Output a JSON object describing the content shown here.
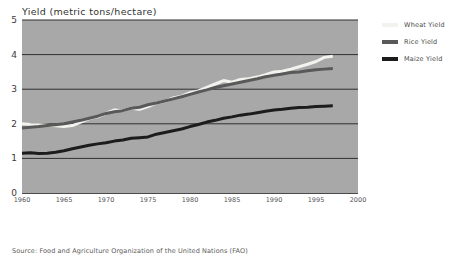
{
  "chart_data": {
    "type": "line",
    "title": "Yield (metric tons/hectare)",
    "xlabel": "",
    "ylabel": "Yield (metric tons/hectare)",
    "xlim": [
      1960,
      2000
    ],
    "ylim": [
      0,
      5
    ],
    "grid": "horizontal",
    "legend_position": "right",
    "y_ticks": [
      "5",
      "4",
      "3",
      "2",
      "1",
      "0"
    ],
    "y_tick_values": [
      5,
      4,
      3,
      2,
      1,
      0
    ],
    "x_ticks": [
      "1960",
      "1965",
      "1970",
      "1975",
      "1980",
      "1985",
      "1990",
      "1995",
      "2000"
    ],
    "x_tick_values": [
      1960,
      1965,
      1970,
      1975,
      1980,
      1985,
      1990,
      1995,
      2000
    ],
    "x": [
      1960,
      1961,
      1962,
      1963,
      1964,
      1965,
      1966,
      1967,
      1968,
      1969,
      1970,
      1971,
      1972,
      1973,
      1974,
      1975,
      1976,
      1977,
      1978,
      1979,
      1980,
      1981,
      1982,
      1983,
      1984,
      1985,
      1986,
      1987,
      1988,
      1989,
      1990,
      1991,
      1992,
      1993,
      1994,
      1995,
      1996,
      1997
    ],
    "series": [
      {
        "name": "Wheat Yield",
        "color": "#f2f2ee",
        "values": [
          2.0,
          1.98,
          1.97,
          1.96,
          1.94,
          1.92,
          1.95,
          2.05,
          2.15,
          2.2,
          2.3,
          2.4,
          2.38,
          2.45,
          2.42,
          2.5,
          2.6,
          2.65,
          2.75,
          2.8,
          2.9,
          2.95,
          3.05,
          3.15,
          3.25,
          3.2,
          3.28,
          3.3,
          3.35,
          3.42,
          3.5,
          3.52,
          3.58,
          3.65,
          3.72,
          3.8,
          3.92,
          3.95
        ]
      },
      {
        "name": "Rice Yield",
        "color": "#595959",
        "values": [
          1.88,
          1.9,
          1.92,
          1.95,
          1.97,
          2.0,
          2.05,
          2.1,
          2.16,
          2.22,
          2.3,
          2.35,
          2.38,
          2.45,
          2.48,
          2.55,
          2.6,
          2.66,
          2.72,
          2.78,
          2.85,
          2.92,
          2.98,
          3.05,
          3.1,
          3.15,
          3.2,
          3.25,
          3.3,
          3.36,
          3.4,
          3.44,
          3.48,
          3.5,
          3.53,
          3.56,
          3.58,
          3.6
        ]
      },
      {
        "name": "Maize Yield",
        "color": "#1c1c1c",
        "values": [
          1.15,
          1.16,
          1.14,
          1.15,
          1.18,
          1.22,
          1.28,
          1.33,
          1.38,
          1.42,
          1.45,
          1.5,
          1.53,
          1.58,
          1.6,
          1.62,
          1.7,
          1.75,
          1.8,
          1.85,
          1.92,
          1.98,
          2.05,
          2.1,
          2.16,
          2.2,
          2.25,
          2.28,
          2.32,
          2.36,
          2.4,
          2.42,
          2.45,
          2.47,
          2.48,
          2.5,
          2.51,
          2.52
        ]
      }
    ]
  },
  "legend": [
    {
      "label": "Wheat Yield",
      "color": "#f2f2ee"
    },
    {
      "label": "Rice Yield",
      "color": "#595959"
    },
    {
      "label": "Maize Yield",
      "color": "#1c1c1c"
    }
  ],
  "source": {
    "note": "Source: Food and Agriculture Organization of the United Nations (FAO)"
  },
  "colors": {
    "plot_background": "#a8a8a8",
    "gridline": "#2f2f2f",
    "axis": "#4a4a4a",
    "page_background": "#ffffff"
  }
}
